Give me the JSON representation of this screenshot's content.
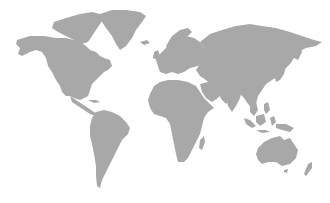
{
  "map": {
    "type": "world-silhouette",
    "land_color": "#a8a8a8",
    "background_color": "#ffffff",
    "regions": [
      "north-america",
      "greenland",
      "south-america",
      "europe",
      "africa",
      "asia",
      "australia",
      "new-zealand",
      "madagascar",
      "japan",
      "indonesia",
      "arctic-islands"
    ]
  }
}
